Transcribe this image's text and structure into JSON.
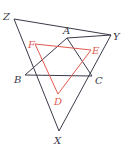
{
  "diagram": {
    "colors": {
      "black": "#3a3a4a",
      "red": "#e05a4f"
    },
    "outer_triangle": {
      "vertices": [
        "Z",
        "Y",
        "X"
      ]
    },
    "middle_triangle": {
      "vertices": [
        "A",
        "B",
        "C"
      ]
    },
    "inner_triangle": {
      "vertices": [
        "D",
        "E",
        "F"
      ]
    },
    "labels": {
      "Z": "Z",
      "A": "A",
      "Y": "Y",
      "F": "F",
      "E": "E",
      "B": "B",
      "C": "C",
      "D": "D",
      "X": "X"
    }
  }
}
